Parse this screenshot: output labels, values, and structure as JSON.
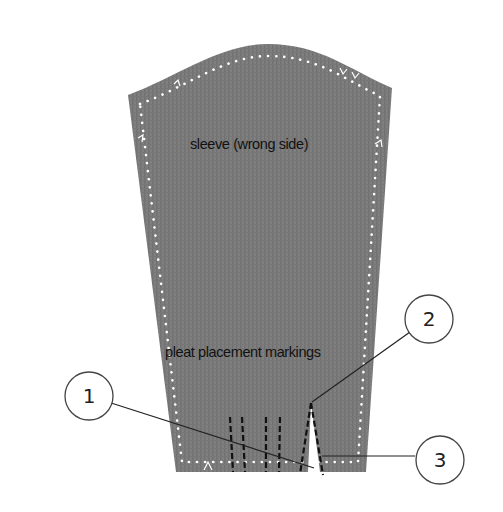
{
  "diagram": {
    "piece_label": "sleeve (wrong side)",
    "markings_label": "pleat placement markings",
    "callouts": [
      {
        "id": "1",
        "label": "1"
      },
      {
        "id": "2",
        "label": "2"
      },
      {
        "id": "3",
        "label": "3"
      }
    ],
    "colors": {
      "fabric": "#7d7d7d",
      "fabric_stripe": "#6f6f6f",
      "seam_dots": "#ffffff",
      "pleat_lines": "#111111",
      "leader_lines": "#222222",
      "callout_fill": "#ffffff",
      "callout_stroke": "#444444"
    }
  }
}
